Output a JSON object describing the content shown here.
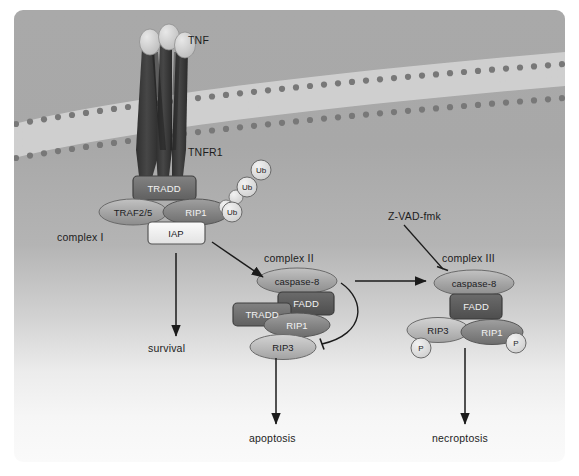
{
  "figure": {
    "background_top_color": "#a9a9a9",
    "background_bottom_color": "#fafafa"
  },
  "ligand": {
    "label": "TNF",
    "subunit_count": 3
  },
  "receptor": {
    "label": "TNFR1",
    "chain_count": 3,
    "color": "#3b3b3b"
  },
  "membrane": {
    "name": "lipid-bilayer",
    "head_color": "#6f6f6f",
    "tail_color": "#d8d8d8"
  },
  "complexes": [
    {
      "label": "complex I",
      "nodes": [
        {
          "name": "TRADD",
          "shape": "box",
          "fill": "#6e6e6e",
          "text_style": "dark"
        },
        {
          "name": "TRAF2/5",
          "shape": "ellipse",
          "fill": "#9a9a9a",
          "text_style": "light"
        },
        {
          "name": "RIP1",
          "shape": "ellipse",
          "fill": "#7e7e7e",
          "text_style": "dark"
        },
        {
          "name": "IAP",
          "shape": "box",
          "fill": "#f0f0f0",
          "text_style": "light"
        }
      ],
      "ubiquitin": {
        "label": "Ub",
        "count": 3
      }
    },
    {
      "label": "complex II",
      "nodes": [
        {
          "name": "caspase-8",
          "shape": "ellipse",
          "fill": "#8f8f8f",
          "text_style": "light"
        },
        {
          "name": "FADD",
          "shape": "box",
          "fill": "#5a5a5a",
          "text_style": "dark"
        },
        {
          "name": "TRADD",
          "shape": "box",
          "fill": "#6e6e6e",
          "text_style": "dark"
        },
        {
          "name": "RIP1",
          "shape": "ellipse",
          "fill": "#7e7e7e",
          "text_style": "dark"
        },
        {
          "name": "RIP3",
          "shape": "ellipse",
          "fill": "#b3b3b3",
          "text_style": "light"
        }
      ]
    },
    {
      "label": "complex III",
      "nodes": [
        {
          "name": "caspase-8",
          "shape": "ellipse",
          "fill": "#8f8f8f",
          "text_style": "light"
        },
        {
          "name": "FADD",
          "shape": "box",
          "fill": "#5a5a5a",
          "text_style": "dark"
        },
        {
          "name": "RIP3",
          "shape": "ellipse",
          "fill": "#b3b3b3",
          "text_style": "light"
        },
        {
          "name": "RIP1",
          "shape": "ellipse",
          "fill": "#7e7e7e",
          "text_style": "dark"
        }
      ],
      "phosphates": [
        {
          "label": "P",
          "on": "RIP3"
        },
        {
          "label": "P",
          "on": "RIP1"
        }
      ]
    }
  ],
  "inhibitor": {
    "label": "Z-VAD-fmk",
    "target": "caspase-8 in complex III",
    "arrow_style": "blunt-inhibition"
  },
  "feedback": {
    "from": "caspase-8",
    "to": "RIP1/RIP3",
    "arrow_style": "curved-blunt-inhibition"
  },
  "outcomes": [
    {
      "label": "survival",
      "from": "complex I"
    },
    {
      "label": "apoptosis",
      "from": "complex II"
    },
    {
      "label": "necroptosis",
      "from": "complex III"
    }
  ],
  "arrows": [
    {
      "name": "complex-i-to-complex-ii",
      "style": "pointed"
    },
    {
      "name": "complex-ii-to-complex-iii",
      "style": "pointed"
    },
    {
      "name": "complex-i-to-survival",
      "style": "pointed"
    },
    {
      "name": "complex-ii-to-apoptosis",
      "style": "pointed"
    },
    {
      "name": "complex-iii-to-necroptosis",
      "style": "pointed"
    }
  ]
}
